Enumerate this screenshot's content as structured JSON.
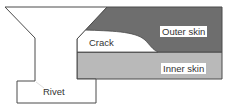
{
  "diagram": {
    "title": "",
    "labels": {
      "outer_skin": "Outer skin",
      "inner_skin": "Inner skin",
      "crack": "Crack",
      "rivet": "Rivet"
    },
    "colors": {
      "outer_skin_fill": "#6e6e6e",
      "inner_skin_fill": "#b9b9b9",
      "crack_fill": "#ffffff",
      "rivet_fill": "#ffffff",
      "outline": "#4a4a4a"
    },
    "components": [
      {
        "id": "rivet",
        "label": "Rivet",
        "description": "Countersunk rivet with head, shank and formed tail"
      },
      {
        "id": "outer-skin",
        "label": "Outer skin",
        "description": "Dark grey upper sheet with countersunk hole"
      },
      {
        "id": "inner-skin",
        "label": "Inner skin",
        "description": "Light grey lower sheet"
      },
      {
        "id": "crack",
        "label": "Crack",
        "description": "White crack region at countersink edge between outer skin and inner skin"
      }
    ]
  }
}
